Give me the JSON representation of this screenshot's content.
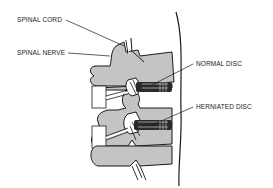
{
  "diagram": {
    "labels": {
      "spinal_cord": "SPINAL CORD",
      "spinal_nerve": "SPINAL NERVE",
      "normal_disc": "NORMAL DISC",
      "herniated_disc": "HERNIATED DISC"
    },
    "colors": {
      "bone": "#c4c4c4",
      "outline": "#1a1a1a",
      "disc": "#2a2a2a",
      "background": "#ffffff",
      "text": "#222222"
    }
  }
}
